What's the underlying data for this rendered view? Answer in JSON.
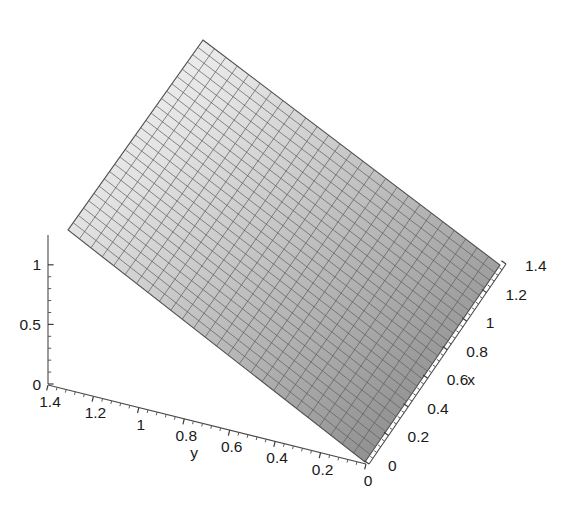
{
  "figure": {
    "kind": "3d-surface-plot",
    "width": 566,
    "height": 524,
    "background": "#ffffff",
    "mesh_line_color": "#5f5f5f",
    "axis_color": "#4a4a4a",
    "text_color": "#1a1a1a"
  },
  "chart_data": {
    "type": "surface",
    "title": "",
    "xlabel": "x",
    "ylabel": "y",
    "zlabel": "",
    "xlim": [
      0,
      1.4
    ],
    "ylim": [
      0,
      1.4
    ],
    "zlim": [
      0,
      1.25
    ],
    "grid": false,
    "legend": "none",
    "surface_function": "z = 0.85 * y",
    "mesh_nx": 26,
    "mesh_ny": 26,
    "shading": {
      "colormap": "grayscale",
      "light_corner": "far-left (x=0, y=1.4)",
      "dark_corner": "near-right (x=1.4, y=0)",
      "light_hex": "#f2f2f2",
      "mid_hex": "#b4b4b4",
      "dark_hex": "#868686"
    },
    "x_values": [
      0,
      0.2,
      0.4,
      0.6,
      0.8,
      1.0,
      1.2,
      1.4
    ],
    "y_values": [
      0,
      0.2,
      0.4,
      0.6,
      0.8,
      1.0,
      1.2,
      1.4
    ],
    "z_values": [
      0,
      0.5,
      1.0
    ],
    "surface_corner_heights": {
      "x0_y0": 0.0,
      "x1.4_y0": 0.0,
      "x0_y1.4": 1.2,
      "x1.4_y1.4": 1.2
    }
  },
  "axes": {
    "x": {
      "name": "x-axis",
      "label": "x",
      "ticks": [
        {
          "value": 0,
          "text": "0"
        },
        {
          "value": 0.2,
          "text": "0.2"
        },
        {
          "value": 0.4,
          "text": "0.4"
        },
        {
          "value": 0.6,
          "text": "0.6"
        },
        {
          "value": 0.8,
          "text": "0.8"
        },
        {
          "value": 1.0,
          "text": "1"
        },
        {
          "value": 1.2,
          "text": "1.2"
        },
        {
          "value": 1.4,
          "text": "1.4"
        }
      ]
    },
    "y": {
      "name": "y-axis",
      "label": "y",
      "ticks": [
        {
          "value": 1.4,
          "text": "1.4"
        },
        {
          "value": 1.2,
          "text": "1.2"
        },
        {
          "value": 1.0,
          "text": "1"
        },
        {
          "value": 0.8,
          "text": "0.8"
        },
        {
          "value": 0.6,
          "text": "0.6"
        },
        {
          "value": 0.4,
          "text": "0.4"
        },
        {
          "value": 0.2,
          "text": "0.2"
        },
        {
          "value": 0,
          "text": "0"
        }
      ]
    },
    "z": {
      "name": "z-axis",
      "label": "",
      "ticks": [
        {
          "value": 0,
          "text": "0"
        },
        {
          "value": 0.5,
          "text": "0.5"
        },
        {
          "value": 1.0,
          "text": "1"
        }
      ]
    }
  }
}
